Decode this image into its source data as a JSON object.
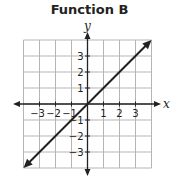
{
  "chart_data": {
    "type": "line",
    "title": "Function B",
    "xlabel": "x",
    "ylabel": "y",
    "xlim": [
      -4,
      4
    ],
    "ylim": [
      -4,
      4
    ],
    "grid": true,
    "x_ticks": [
      "−3",
      "−2",
      "−1",
      "1",
      "2",
      "3"
    ],
    "y_ticks": [
      "3",
      "2",
      "1",
      "−1",
      "−2",
      "−3"
    ],
    "series": [
      {
        "name": "Function B",
        "equation": "y = x",
        "x": [
          -4,
          4
        ],
        "y": [
          -4,
          4
        ],
        "arrows_both_ends": true
      }
    ]
  },
  "colors": {
    "line": "#222222",
    "grid": "#b5b5b5",
    "axis": "#222222"
  }
}
